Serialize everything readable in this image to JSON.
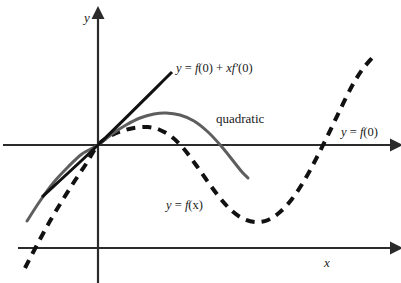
{
  "figure": {
    "background_color": "#ffffff"
  },
  "axes": {
    "y_axis_label": "y",
    "x_axis_label": "x",
    "origin": {
      "x": 98,
      "y": 145
    },
    "vertical_axis": {
      "x": 98,
      "y_top": 15,
      "y_bottom": 283,
      "arrow": "up"
    },
    "upper_horizontal_axis": {
      "y": 145,
      "x_left": 3,
      "x_right": 396,
      "arrow": "right"
    },
    "lower_horizontal_axis": {
      "y": 248,
      "x_left": 18,
      "x_right": 396,
      "arrow": "right"
    },
    "axis_color": "#2b2b2b"
  },
  "labels": {
    "tangent": {
      "full_text": "y = f(0) + xf'(0)",
      "parts": {
        "y": "y",
        "eq": " = ",
        "f": "f",
        "arg0": "(0)",
        "plus": " + ",
        "x": "x",
        "fprime": "f",
        "prime": "′",
        "arg0b": "(0)"
      }
    },
    "quadratic": "quadratic",
    "horizontal_line": {
      "full_text": "y = f(0)",
      "parts": {
        "y": "y",
        "eq": " = ",
        "f": "f",
        "arg": "(0)"
      }
    },
    "function": {
      "full_text": "y = f(x)",
      "parts": {
        "y": "y",
        "eq": " = ",
        "f": "f",
        "arg": "(x)"
      }
    }
  },
  "chart_data": {
    "type": "line",
    "xlabel": "x",
    "ylabel": "y",
    "grid": false,
    "legend": "inline-annotations",
    "axis_note": "The upper horizontal line is both the x-axis of the function graph and the line y = f(0).",
    "series": [
      {
        "name": "y = f(x)",
        "style": "dashed",
        "color": "#111111",
        "width": 4,
        "description": "Cubic-like curve: rises steeply from lower left, inflects at origin, local maximum, local minimum, then rises steeply at right.",
        "points": [
          [
            25,
            268
          ],
          [
            38,
            243
          ],
          [
            50,
            221
          ],
          [
            62,
            201
          ],
          [
            74,
            182
          ],
          [
            86,
            164
          ],
          [
            98,
            145
          ],
          [
            110,
            136
          ],
          [
            122,
            131
          ],
          [
            134,
            128
          ],
          [
            148,
            127
          ],
          [
            160,
            130
          ],
          [
            172,
            137
          ],
          [
            184,
            149
          ],
          [
            196,
            165
          ],
          [
            208,
            182
          ],
          [
            220,
            198
          ],
          [
            232,
            211
          ],
          [
            244,
            219
          ],
          [
            256,
            222
          ],
          [
            268,
            220
          ],
          [
            280,
            212
          ],
          [
            292,
            199
          ],
          [
            304,
            181
          ],
          [
            316,
            159
          ],
          [
            328,
            135
          ],
          [
            340,
            110
          ],
          [
            352,
            86
          ],
          [
            362,
            70
          ],
          [
            372,
            58
          ]
        ],
        "features": {
          "local_max": [
            150,
            127
          ],
          "local_min": [
            258,
            222
          ],
          "inflection": [
            98,
            145
          ],
          "x_intercepts_upper_axis": [
            98,
            310
          ]
        }
      },
      {
        "name": "quadratic",
        "style": "solid",
        "color": "#5e5e5e",
        "width": 3,
        "description": "Second-order Taylor polynomial: concave-down parabola through the origin, tangent to f at x = 0.",
        "points": [
          [
            27,
            221
          ],
          [
            40,
            201
          ],
          [
            54,
            182
          ],
          [
            68,
            167
          ],
          [
            82,
            154
          ],
          [
            98,
            145
          ],
          [
            112,
            134
          ],
          [
            126,
            125
          ],
          [
            140,
            118
          ],
          [
            154,
            114
          ],
          [
            166,
            113
          ],
          [
            180,
            115
          ],
          [
            194,
            121
          ],
          [
            208,
            132
          ],
          [
            222,
            147
          ],
          [
            234,
            162
          ],
          [
            242,
            172
          ],
          [
            248,
            178
          ]
        ],
        "features": {
          "vertex": [
            166,
            113
          ]
        }
      },
      {
        "name": "y = f(0) + xf'(0)",
        "style": "solid",
        "color": "#111111",
        "width": 3,
        "description": "First-order Taylor polynomial: straight tangent line to f at x = 0.",
        "points": [
          [
            42,
            197
          ],
          [
            98,
            145
          ],
          [
            172,
            72
          ]
        ],
        "features": {
          "passes_through_origin": true,
          "slope_sign": "positive"
        }
      }
    ]
  },
  "colors": {
    "axis": "#2b2b2b",
    "curve_dashed": "#111111",
    "curve_quadratic": "#5e5e5e",
    "curve_tangent": "#111111",
    "text": "#1a1a1a"
  }
}
